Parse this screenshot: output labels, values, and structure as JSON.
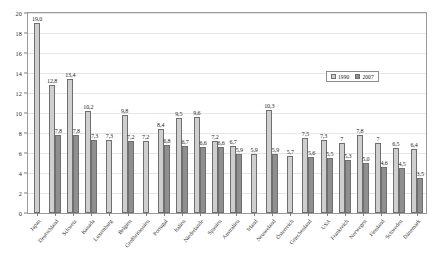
{
  "chart_data": {
    "type": "bar",
    "title": "",
    "xlabel": "",
    "ylabel": "",
    "ylim": [
      0,
      20
    ],
    "yticks": [
      0,
      2,
      4,
      6,
      8,
      10,
      12,
      14,
      16,
      18,
      20
    ],
    "ytick_labels": [
      "0",
      "2",
      "4",
      "6",
      "8",
      "10",
      "12",
      "14",
      "16",
      "18",
      "20"
    ],
    "grid": true,
    "legend_position": "top-right",
    "categories": [
      "Japan",
      "Deutschland",
      "Schweiz",
      "Kanada",
      "Luxemburg",
      "Belgien",
      "Großbritannien",
      "Portugal",
      "Italien",
      "Niederlande",
      "Spanien",
      "Australien",
      "Irland",
      "Neuseeland",
      "Österreich",
      "Griechenland",
      "USA",
      "Frankreich",
      "Norwegen",
      "Finnland",
      "Schweden",
      "Dänemark"
    ],
    "series": [
      {
        "name": "1990",
        "color": "#cfcfcf",
        "values": [
          19.0,
          12.8,
          13.4,
          10.2,
          7.3,
          9.8,
          7.2,
          8.4,
          9.5,
          9.6,
          7.2,
          6.7,
          5.9,
          10.3,
          5.7,
          7.5,
          7.3,
          7.0,
          7.8,
          7.0,
          6.5,
          6.4
        ],
        "value_labels": [
          "19,0",
          "12,8",
          "13,4",
          "10,2",
          "7,3",
          "9,8",
          "7,2",
          "8,4",
          "9,5",
          "9,6",
          "7,2",
          "6,7",
          "5,9",
          "10,3",
          "5,7",
          "7,5",
          "7,3",
          "7",
          "7,8",
          "7",
          "6,5",
          "6,4"
        ]
      },
      {
        "name": "2007",
        "color": "#8f8f8f",
        "values": [
          null,
          7.8,
          7.8,
          7.3,
          null,
          7.2,
          null,
          6.8,
          6.7,
          6.6,
          6.6,
          5.9,
          null,
          5.9,
          null,
          5.6,
          5.5,
          5.3,
          5.0,
          4.6,
          4.5,
          3.5
        ],
        "value_labels": [
          null,
          "7,8",
          "7,8",
          "7,3",
          null,
          "7,2",
          null,
          "6,8",
          "6,7",
          "6,6",
          "6,6",
          "5,9",
          null,
          "5,9",
          null,
          "5,6",
          "5,5",
          "5,3",
          "5,0",
          "4,6",
          "4,5",
          "3,5"
        ]
      }
    ]
  },
  "legend": {
    "entries": [
      {
        "label": "1990",
        "color": "#cfcfcf"
      },
      {
        "label": "2007",
        "color": "#8f8f8f"
      }
    ]
  }
}
